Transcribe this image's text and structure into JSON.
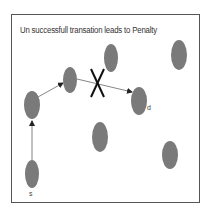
{
  "title": "Un successfull transation leads to Penalty",
  "colors": {
    "node_fill": "#7a7a7a",
    "edge": "#555555",
    "cross": "#111111",
    "frame": "#555555"
  },
  "nodes": [
    {
      "id": "s",
      "label": "s",
      "cx": 32,
      "cy": 174
    },
    {
      "id": "n1",
      "label": "",
      "cx": 32,
      "cy": 105
    },
    {
      "id": "n2",
      "label": "",
      "cx": 70,
      "cy": 80
    },
    {
      "id": "n3",
      "label": "",
      "cx": 111,
      "cy": 58
    },
    {
      "id": "n4",
      "label": "",
      "cx": 179,
      "cy": 55
    },
    {
      "id": "d",
      "label": "d",
      "cx": 139,
      "cy": 101
    },
    {
      "id": "n5",
      "label": "",
      "cx": 100,
      "cy": 137
    },
    {
      "id": "n6",
      "label": "",
      "cx": 170,
      "cy": 155
    }
  ],
  "edges": [
    {
      "from": "s",
      "to": "n1"
    },
    {
      "from": "n1",
      "to": "n2"
    },
    {
      "from": "n2",
      "to": "d",
      "failed": true
    }
  ],
  "labels": {
    "source": "s",
    "destination": "d"
  }
}
